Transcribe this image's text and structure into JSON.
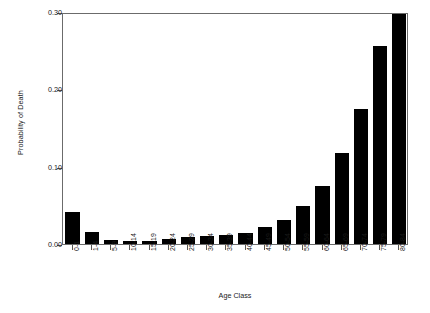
{
  "chart_data": {
    "type": "bar",
    "title": "",
    "xlabel": "Age Class",
    "ylabel": "Probability of Death",
    "categories": [
      "0-1",
      "1-4",
      "5-9",
      "10-14",
      "15-19",
      "20-24",
      "25-29",
      "30-34",
      "35-39",
      "40-44",
      "45-49",
      "50-54",
      "55-59",
      "60-64",
      "65-69",
      "70-74",
      "75-79",
      "80-84"
    ],
    "values": [
      0.042,
      0.015,
      0.005,
      0.004,
      0.004,
      0.007,
      0.009,
      0.011,
      0.012,
      0.014,
      0.022,
      0.031,
      0.049,
      0.075,
      0.118,
      0.175,
      0.256,
      0.3
    ],
    "ylim": [
      0.0,
      0.3
    ],
    "yticks": [
      0.0,
      0.1,
      0.2,
      0.3
    ],
    "ytick_labels": [
      "0.00",
      "0.10",
      "0.20",
      "0.30"
    ],
    "grid": false,
    "legend": null,
    "bar_color": "#000000",
    "frame_color": "#6b6b6b"
  }
}
